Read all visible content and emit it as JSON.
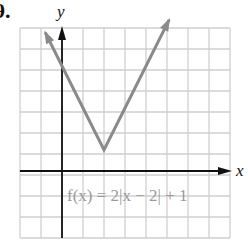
{
  "problem": {
    "number_label": "9."
  },
  "chart_data": {
    "type": "line",
    "title": "",
    "function_label": "f(x) = 2|x − 2| + 1",
    "xlabel": "x",
    "ylabel": "y",
    "xlim": [
      -2,
      8
    ],
    "ylim": [
      -3,
      7
    ],
    "grid": true,
    "vertex": {
      "x": 2,
      "y": 1
    },
    "series": [
      {
        "name": "f(x) = 2|x - 2| + 1",
        "x": [
          -0.8,
          0,
          1,
          2,
          3,
          4,
          5.1
        ],
        "y": [
          6.6,
          5,
          3,
          1,
          3,
          5,
          7.2
        ]
      }
    ],
    "arrows": {
      "left_end": true,
      "right_end": true
    },
    "colors": {
      "curve": "#8a8a8a",
      "axis": "#111111",
      "grid": "#cfcfcf",
      "label": "#9a9a9a"
    }
  }
}
